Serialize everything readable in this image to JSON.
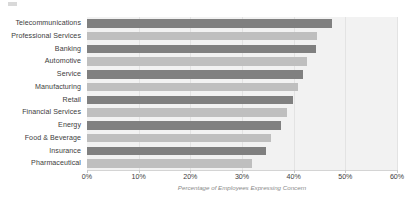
{
  "chart_data": {
    "type": "bar",
    "orientation": "horizontal",
    "title": "",
    "xlabel": "Percentage of Employees Expressing Concern",
    "ylabel": "",
    "xlim": [
      0,
      60
    ],
    "xtick_labels": [
      "0%",
      "10%",
      "20%",
      "30%",
      "40%",
      "50%",
      "60%"
    ],
    "xticks": [
      0,
      10,
      20,
      30,
      40,
      50,
      60
    ],
    "grid": true,
    "legend": "none",
    "categories": [
      "Telecommunications",
      "Professional Services",
      "Banking",
      "Automotive",
      "Service",
      "Manufacturing",
      "Retail",
      "Financial Services",
      "Energy",
      "Food & Beverage",
      "Insurance",
      "Pharmaceutical"
    ],
    "values": [
      47.4,
      44.6,
      44.4,
      42.5,
      41.8,
      40.8,
      39.8,
      38.8,
      37.6,
      35.6,
      34.7,
      31.9
    ],
    "bar_colors": [
      "#808080",
      "#bfbfbf",
      "#808080",
      "#bfbfbf",
      "#808080",
      "#bfbfbf",
      "#808080",
      "#bfbfbf",
      "#808080",
      "#bfbfbf",
      "#808080",
      "#bfbfbf"
    ]
  },
  "style": {
    "plot_background": "#f2f2f2",
    "page_background": "#ffffff",
    "gridline_color": "#e3e3e3",
    "axis_line_color": "#d4d4d4",
    "label_color": "#3d3d3d",
    "axis_title_color": "#8a8a8a",
    "dark_bar": "#808080",
    "light_bar": "#bfbfbf"
  }
}
